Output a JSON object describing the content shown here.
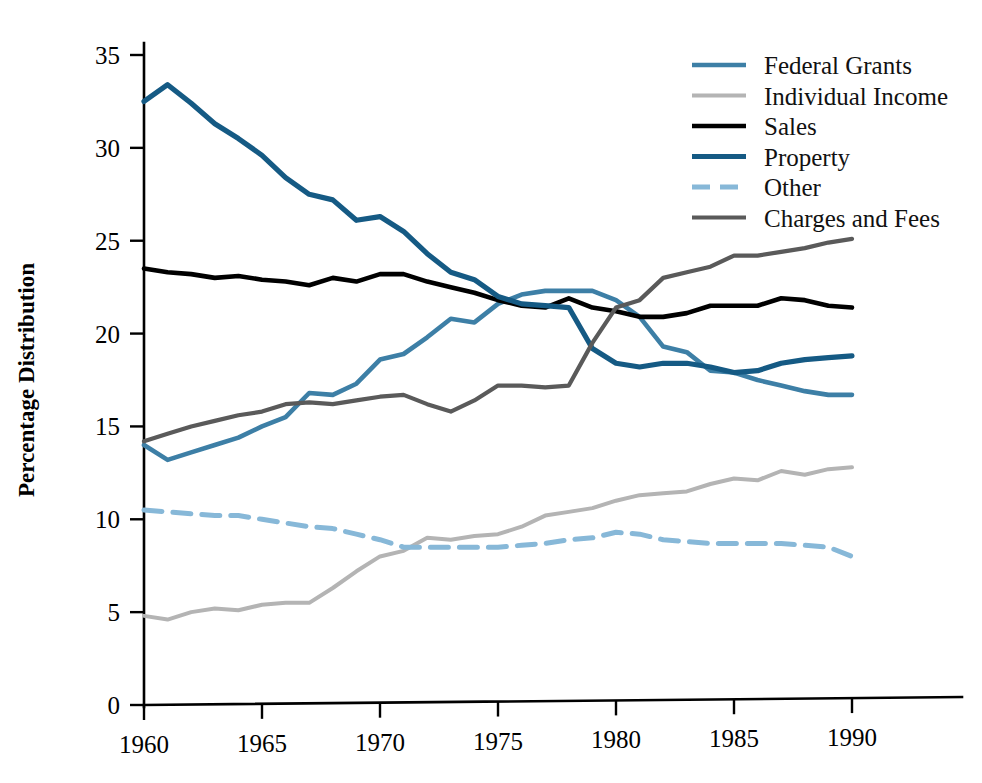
{
  "chart_data": {
    "type": "line",
    "title": "",
    "xlabel": "",
    "ylabel": "Percentage Distribution",
    "xlim": [
      1960,
      1994
    ],
    "ylim": [
      0,
      35
    ],
    "grid": false,
    "legend_position": "top-right",
    "x_ticks": [
      "1960",
      "1965",
      "1970",
      "1975",
      "1980",
      "1985",
      "1990"
    ],
    "x_tick_values": [
      1960,
      1965,
      1970,
      1975,
      1980,
      1985,
      1990
    ],
    "y_ticks": [
      "0",
      "5",
      "10",
      "15",
      "20",
      "25",
      "30",
      "35"
    ],
    "y_tick_values": [
      0,
      5,
      10,
      15,
      20,
      25,
      30,
      35
    ],
    "x": [
      1960,
      1961,
      1962,
      1963,
      1964,
      1965,
      1966,
      1967,
      1968,
      1969,
      1970,
      1971,
      1972,
      1973,
      1974,
      1975,
      1976,
      1977,
      1978,
      1979,
      1980,
      1981,
      1982,
      1983,
      1984,
      1985,
      1986,
      1987,
      1988,
      1989,
      1990
    ],
    "series": [
      {
        "name": "Federal Grants",
        "color": "#3d7fa6",
        "dash": "none",
        "width": 4.6,
        "values": [
          14.0,
          13.2,
          13.6,
          14.0,
          14.4,
          15.0,
          15.5,
          16.8,
          16.7,
          17.3,
          18.6,
          18.9,
          19.8,
          20.8,
          20.6,
          21.6,
          22.1,
          22.3,
          22.3,
          22.3,
          21.8,
          20.9,
          19.3,
          19.0,
          18.0,
          17.9,
          17.5,
          17.2,
          16.9,
          16.7,
          16.7
        ]
      },
      {
        "name": "Individual Income",
        "color": "#b4b4b4",
        "dash": "none",
        "width": 4.0,
        "values": [
          4.8,
          4.6,
          5.0,
          5.2,
          5.1,
          5.4,
          5.5,
          5.5,
          6.3,
          7.2,
          8.0,
          8.3,
          9.0,
          8.9,
          9.1,
          9.2,
          9.6,
          10.2,
          10.4,
          10.6,
          11.0,
          11.3,
          11.4,
          11.5,
          11.9,
          12.2,
          12.1,
          12.6,
          12.4,
          12.7,
          12.8
        ]
      },
      {
        "name": "Sales",
        "color": "#000000",
        "dash": "none",
        "width": 4.6,
        "values": [
          23.5,
          23.3,
          23.2,
          23.0,
          23.1,
          22.9,
          22.8,
          22.6,
          23.0,
          22.8,
          23.2,
          23.2,
          22.8,
          22.5,
          22.2,
          21.8,
          21.5,
          21.4,
          21.9,
          21.4,
          21.2,
          20.9,
          20.9,
          21.1,
          21.5,
          21.5,
          21.5,
          21.9,
          21.8,
          21.5,
          21.4
        ]
      },
      {
        "name": "Property",
        "color": "#155a84",
        "dash": "none",
        "width": 5.2,
        "values": [
          32.5,
          33.4,
          32.4,
          31.3,
          30.5,
          29.6,
          28.4,
          27.5,
          27.2,
          26.1,
          26.3,
          25.5,
          24.3,
          23.3,
          22.9,
          22.0,
          21.6,
          21.5,
          21.4,
          19.2,
          18.4,
          18.2,
          18.4,
          18.4,
          18.2,
          17.9,
          18.0,
          18.4,
          18.6,
          18.7,
          18.8
        ]
      },
      {
        "name": "Other",
        "color": "#87b8d8",
        "dash": "18,11",
        "width": 5.0,
        "values": [
          10.5,
          10.4,
          10.3,
          10.2,
          10.2,
          10.0,
          9.8,
          9.6,
          9.5,
          9.2,
          8.9,
          8.5,
          8.5,
          8.5,
          8.5,
          8.5,
          8.6,
          8.7,
          8.9,
          9.0,
          9.3,
          9.2,
          8.9,
          8.8,
          8.7,
          8.7,
          8.7,
          8.7,
          8.6,
          8.5,
          8.0
        ]
      },
      {
        "name": "Charges and Fees",
        "color": "#5a5a5a",
        "dash": "none",
        "width": 4.2,
        "values": [
          14.2,
          14.6,
          15.0,
          15.3,
          15.6,
          15.8,
          16.2,
          16.3,
          16.2,
          16.4,
          16.6,
          16.7,
          16.2,
          15.8,
          16.4,
          17.2,
          17.2,
          17.1,
          17.2,
          19.5,
          21.4,
          21.8,
          23.0,
          23.3,
          23.6,
          24.2,
          24.2,
          24.4,
          24.6,
          24.9,
          25.1
        ]
      }
    ]
  },
  "legend": {
    "items": [
      {
        "label": "Federal Grants"
      },
      {
        "label": "Individual Income"
      },
      {
        "label": "Sales"
      },
      {
        "label": "Property"
      },
      {
        "label": "Other"
      },
      {
        "label": "Charges and Fees"
      }
    ]
  }
}
